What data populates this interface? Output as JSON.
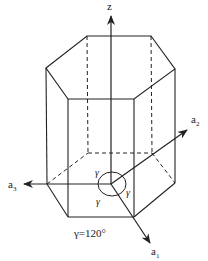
{
  "diagram": {
    "axes": {
      "z": {
        "label": "z"
      },
      "a1": {
        "label": "a",
        "subscript": "1"
      },
      "a2": {
        "label": "a",
        "subscript": "2"
      },
      "a3": {
        "label": "a",
        "subscript": "3"
      }
    },
    "angle_marks": [
      "γ",
      "γ",
      "γ"
    ],
    "caption": "γ=120°",
    "colors": {
      "line": "#222222",
      "background": "#ffffff"
    }
  }
}
